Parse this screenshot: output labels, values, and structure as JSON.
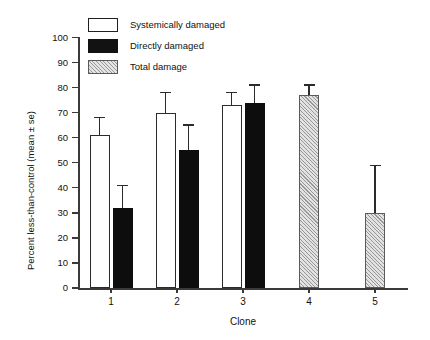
{
  "chart_data": {
    "type": "bar",
    "title": "",
    "subtitle": "",
    "xlabel": "Clone",
    "ylabel": "Percent less-than-control (mean ± se)",
    "categories": [
      "1",
      "2",
      "3",
      "4",
      "5"
    ],
    "ylim": [
      0,
      100
    ],
    "ytick_values": [
      0,
      10,
      20,
      30,
      40,
      50,
      60,
      70,
      80,
      90,
      100
    ],
    "ytick_labels": [
      "0",
      "10",
      "20",
      "30",
      "40",
      "50",
      "60",
      "70",
      "80",
      "90",
      "100"
    ],
    "grid": false,
    "legend_position": "top-left",
    "frame": "left-and-bottom-spines-only",
    "series": [
      {
        "name": "Systemically damaged",
        "fill": "white",
        "edge": "#2b2b2b",
        "values": [
          61,
          70,
          73,
          null,
          null
        ],
        "errors": [
          7,
          8,
          5,
          null,
          null
        ]
      },
      {
        "name": "Directly damaged",
        "fill": "#0d0d0d",
        "edge": "#0d0d0d",
        "values": [
          32,
          55,
          74,
          null,
          null
        ],
        "errors": [
          9,
          10,
          7,
          null,
          null
        ]
      },
      {
        "name": "Total damage",
        "fill": "hatched-gray",
        "edge": "#5a5a5a",
        "values": [
          null,
          null,
          null,
          77,
          30
        ],
        "errors": [
          null,
          null,
          null,
          4,
          19
        ]
      }
    ]
  },
  "legend": {
    "items": [
      {
        "label": "Systemically damaged",
        "swatch": "white-open-square"
      },
      {
        "label": "Directly damaged",
        "swatch": "solid-black-square"
      },
      {
        "label": "Total damage",
        "swatch": "hatched-gray-square"
      }
    ]
  },
  "axes": {
    "y": {
      "label": "Percent less-than-control (mean ± se)",
      "ticks": [
        "0",
        "10",
        "20",
        "30",
        "40",
        "50",
        "60",
        "70",
        "80",
        "90",
        "100"
      ]
    },
    "x": {
      "label": "Clone",
      "ticks": [
        "1",
        "2",
        "3",
        "4",
        "5"
      ]
    }
  }
}
